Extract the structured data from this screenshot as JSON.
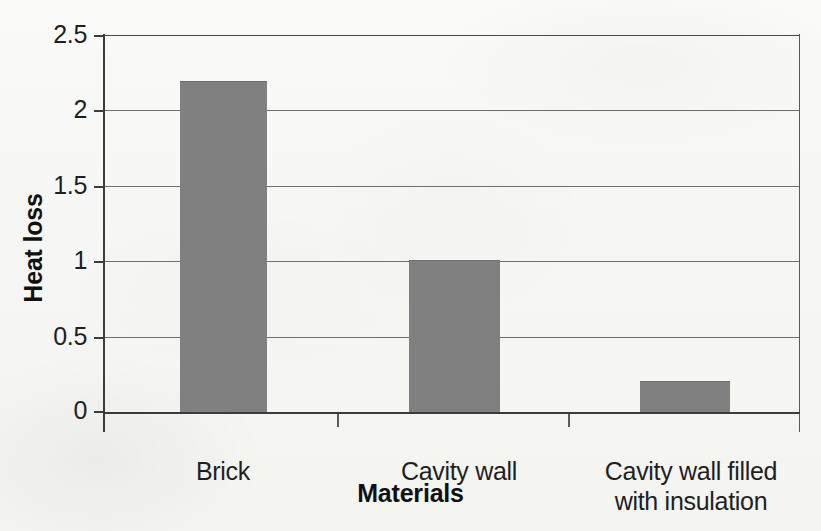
{
  "chart_data": {
    "type": "bar",
    "title": "",
    "xlabel": "Materials",
    "ylabel": "Heat loss",
    "categories": [
      "Brick",
      "Cavity wall",
      "Cavity wall filled with insulation"
    ],
    "category_lines": [
      [
        "Brick"
      ],
      [
        "Cavity wall"
      ],
      [
        "Cavity wall filled",
        "with insulation"
      ]
    ],
    "values": [
      2.19,
      1.0,
      0.2
    ],
    "ylim": [
      0,
      2.5
    ],
    "ytick_labels": [
      "2.5",
      "2",
      "1.5",
      "1",
      "0.5",
      "0"
    ],
    "ytick_values": [
      2.5,
      2,
      1.5,
      1,
      0.5,
      0
    ],
    "grid": true,
    "legend": "none",
    "bar_color": "#808080",
    "axis_color": "#3c3c3c",
    "gridline_color": "#6f6f6f",
    "background_color": "#f8f8f6"
  },
  "axes": {
    "y_title": "Heat loss",
    "x_title": "Materials"
  },
  "ticks": {
    "y": [
      {
        "label": "2.5",
        "value": 2.5
      },
      {
        "label": "2",
        "value": 2
      },
      {
        "label": "1.5",
        "value": 1.5
      },
      {
        "label": "1",
        "value": 1
      },
      {
        "label": "0.5",
        "value": 0.5
      },
      {
        "label": "0",
        "value": 0
      }
    ]
  },
  "bars": [
    {
      "label": "Brick",
      "line1": "Brick",
      "line2": "",
      "value": 2.19
    },
    {
      "label": "Cavity wall",
      "line1": "Cavity wall",
      "line2": "",
      "value": 1.0
    },
    {
      "label": "Cavity wall filled with insulation",
      "line1": "Cavity wall filled",
      "line2": "with insulation",
      "value": 0.2
    }
  ]
}
